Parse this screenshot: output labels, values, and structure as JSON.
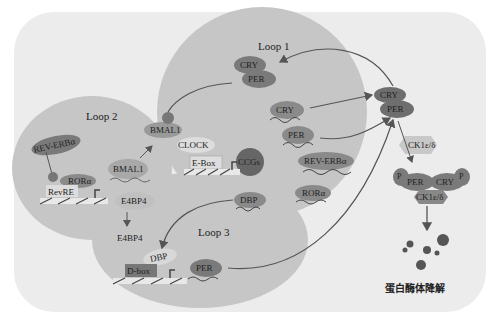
{
  "colors": {
    "panel": "#ececec",
    "loop_fill": "#c8c8c8",
    "dark_protein": "#7a7a7a",
    "mid_protein": "#9a9a9a",
    "light_protein": "#b4b4b4",
    "box": "#dcdcdc",
    "line": "#555555"
  },
  "loops": {
    "loop1": "Loop 1",
    "loop2": "Loop 2",
    "loop3": "Loop 3"
  },
  "loop1": {
    "cry_per_complex": {
      "cry": "CRY",
      "per": "PER"
    },
    "cry": "CRY",
    "per": "PER",
    "rev_erba": "REV-ERBα",
    "rora": "RORα",
    "dbp": "DBP",
    "ccgs": "CCGs",
    "ebox": "E-Box",
    "clock": "CLOCK",
    "bmal1": "BMAL1"
  },
  "loop2": {
    "rev_erba": "REV-ERBα",
    "rora": "RORα",
    "revre": "RevRE",
    "bmal1": "BMAL1",
    "e4bp4": "E4BP4"
  },
  "loop3": {
    "e4bp4": "E4BP4",
    "dbp": "DBP",
    "dbox": "D-box",
    "per": "PER"
  },
  "cytoplasm": {
    "cry": "CRY",
    "per": "PER",
    "kinase": "CK1ε/δ",
    "phospho_per": "PER",
    "phospho_cry": "CRY",
    "phospho_kinase": "CK1ε/δ",
    "p_label": "P",
    "degradation": "蛋白酶体降解"
  }
}
